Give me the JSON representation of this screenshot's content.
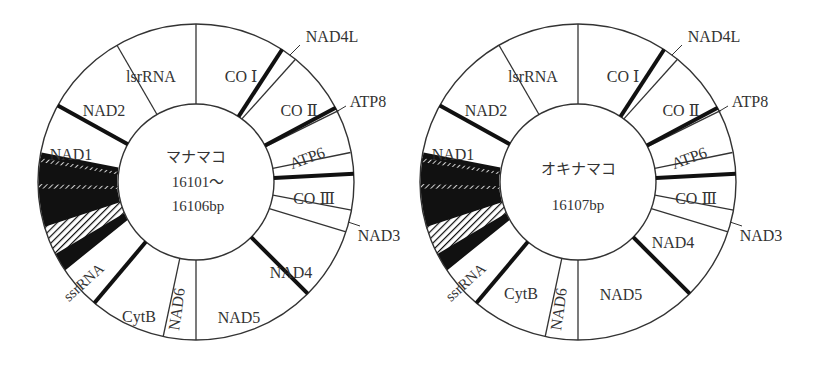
{
  "figure": {
    "maps": [
      {
        "id": "manamako",
        "center_title": "マナマコ",
        "center_size_line1": "16101～",
        "center_size_line2": "16106bp",
        "cx": 196,
        "cy": 182
      },
      {
        "id": "okinamako",
        "center_title": "オキナマコ",
        "center_size_line1": "16107bp",
        "center_size_line2": "",
        "cx": 578,
        "cy": 182
      }
    ],
    "ring": {
      "r_outer": 158,
      "r_inner": 78
    },
    "genes": [
      {
        "label": "CO Ⅰ",
        "start": 0,
        "end": 33,
        "pos": "in",
        "rot": 0
      },
      {
        "label": "NAD4L",
        "start": 33,
        "end": 38,
        "pos": "out",
        "rot": 0
      },
      {
        "label": "CO Ⅱ",
        "start": 38,
        "end": 58,
        "pos": "in",
        "rot": 0
      },
      {
        "label": "ATP8",
        "start": 58,
        "end": 62,
        "pos": "out",
        "rot": 0
      },
      {
        "label": "ATP6",
        "start": 62,
        "end": 79,
        "pos": "in",
        "rot": -20
      },
      {
        "label": "CO Ⅲ",
        "start": 79,
        "end": 98,
        "pos": "in",
        "rot": 0
      },
      {
        "label": "NAD3",
        "start": 98,
        "end": 110,
        "pos": "out",
        "rot": 0
      },
      {
        "label": "NAD4",
        "start": 110,
        "end": 145,
        "pos": "in",
        "rot": 0
      },
      {
        "label": "NAD5",
        "start": 145,
        "end": 180,
        "pos": "in",
        "rot": 0
      },
      {
        "label": "NAD6",
        "start": 180,
        "end": 192,
        "pos": "in",
        "rot": -80
      },
      {
        "label": "CytB",
        "start": 192,
        "end": 220,
        "pos": "in",
        "rot": 0
      },
      {
        "label": "ssrRNA",
        "start": 220,
        "end": 244,
        "pos": "in",
        "rot": -40
      },
      {
        "label": "",
        "start": 244,
        "end": 281,
        "pos": "none",
        "rot": 0
      },
      {
        "label": "NAD1",
        "start": 281,
        "end": 299,
        "pos": "in",
        "rot": 0
      },
      {
        "label": "NAD2",
        "start": 299,
        "end": 330,
        "pos": "in",
        "rot": 0
      },
      {
        "label": "lsrRNA",
        "start": 330,
        "end": 360,
        "pos": "in",
        "rot": 0
      }
    ],
    "labels": {
      "co1": "CO Ⅰ",
      "nad4l": "NAD4L",
      "co2": "CO Ⅱ",
      "atp8": "ATP8",
      "atp6": "ATP6",
      "co3": "CO Ⅲ",
      "nad3": "NAD3",
      "nad4": "NAD4",
      "nad5": "NAD5",
      "nad6": "NAD6",
      "cytb": "CytB",
      "ssrrna": "ssrRNA",
      "nad1": "NAD1",
      "nad2": "NAD2",
      "lsrrna": "lsrRNA"
    },
    "colors": {
      "line": "#333333",
      "fill": "#ffffff",
      "dark": "#111111"
    }
  }
}
